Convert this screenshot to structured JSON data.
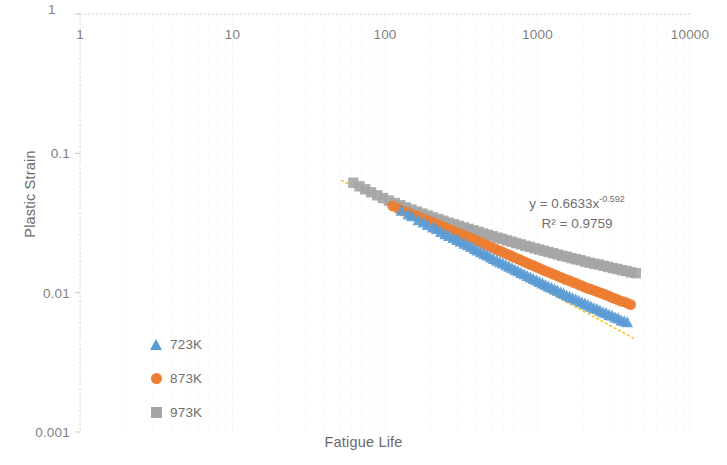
{
  "chart_data": {
    "type": "scatter",
    "title": "",
    "xlabel": "Fatigue Life",
    "ylabel": "Plastic Strain",
    "xscale": "log",
    "yscale": "log",
    "xlim": [
      1,
      10000
    ],
    "ylim": [
      0.001,
      1
    ],
    "xticks": [
      "1",
      "10",
      "100",
      "1000",
      "10000"
    ],
    "xtick_values": [
      1,
      10,
      100,
      1000,
      10000
    ],
    "yticks": [
      "1",
      "0.1",
      "0.01",
      "0.001"
    ],
    "ytick_values": [
      1,
      0.1,
      0.01,
      0.001
    ],
    "xaxis_position": "top",
    "grid": "minor-dotted",
    "legend_position": "inside-lower-left",
    "annotation": {
      "equation_prefix": "y = 0.6633x",
      "equation_exponent": "-0.592",
      "r_squared": "R² = 0.9759",
      "coefficient": 0.6633,
      "exponent": -0.592,
      "r2": 0.9759
    },
    "trendline": {
      "type": "power",
      "style": "dotted",
      "color": "#FFC000",
      "x_start": 52,
      "x_end": 4300
    },
    "colors": {
      "series_723K": "#5B9BD5",
      "series_873K": "#ED7D31",
      "series_973K": "#A5A5A5",
      "axis_text": "#7f7f7f",
      "grid": "#d9d9d9"
    },
    "series": [
      {
        "name": "723K",
        "marker": "triangle",
        "color": "#5B9BD5",
        "points": [
          [
            128,
            0.0385
          ],
          [
            142,
            0.0362
          ],
          [
            150,
            0.0352
          ],
          [
            165,
            0.033
          ],
          [
            178,
            0.0318
          ],
          [
            190,
            0.0305
          ],
          [
            205,
            0.0292
          ],
          [
            218,
            0.0285
          ],
          [
            232,
            0.0272
          ],
          [
            248,
            0.0262
          ],
          [
            262,
            0.0254
          ],
          [
            280,
            0.0246
          ],
          [
            296,
            0.0238
          ],
          [
            312,
            0.0231
          ],
          [
            330,
            0.0224
          ],
          [
            348,
            0.0218
          ],
          [
            366,
            0.0212
          ],
          [
            386,
            0.0205
          ],
          [
            404,
            0.02
          ],
          [
            424,
            0.0194
          ],
          [
            446,
            0.0189
          ],
          [
            468,
            0.0184
          ],
          [
            490,
            0.0179
          ],
          [
            514,
            0.0174
          ],
          [
            540,
            0.0169
          ],
          [
            566,
            0.0165
          ],
          [
            592,
            0.0161
          ],
          [
            620,
            0.0157
          ],
          [
            650,
            0.0153
          ],
          [
            680,
            0.0149
          ],
          [
            712,
            0.0145
          ],
          [
            745,
            0.0142
          ],
          [
            780,
            0.0138
          ],
          [
            818,
            0.0135
          ],
          [
            856,
            0.0131
          ],
          [
            896,
            0.0128
          ],
          [
            938,
            0.0125
          ],
          [
            982,
            0.0122
          ],
          [
            1028,
            0.0119
          ],
          [
            1076,
            0.0116
          ],
          [
            1126,
            0.0113
          ],
          [
            1178,
            0.011
          ],
          [
            1234,
            0.0108
          ],
          [
            1292,
            0.0105
          ],
          [
            1352,
            0.0103
          ],
          [
            1416,
            0.01
          ],
          [
            1482,
            0.0098
          ],
          [
            1552,
            0.0095
          ],
          [
            1624,
            0.0093
          ],
          [
            1700,
            0.0091
          ],
          [
            1780,
            0.0089
          ],
          [
            1864,
            0.0087
          ],
          [
            1952,
            0.0085
          ],
          [
            2044,
            0.0083
          ],
          [
            2140,
            0.0081
          ],
          [
            2240,
            0.0079
          ],
          [
            2345,
            0.0077
          ],
          [
            2455,
            0.0076
          ],
          [
            2570,
            0.0074
          ],
          [
            2690,
            0.0072
          ],
          [
            2815,
            0.0071
          ],
          [
            2948,
            0.0069
          ],
          [
            3085,
            0.0068
          ],
          [
            3230,
            0.0066
          ],
          [
            3380,
            0.0065
          ],
          [
            3540,
            0.0063
          ],
          [
            3705,
            0.0062
          ],
          [
            3880,
            0.0061
          ]
        ]
      },
      {
        "name": "873K",
        "marker": "circle",
        "color": "#ED7D31",
        "points": [
          [
            112,
            0.042
          ],
          [
            122,
            0.04
          ],
          [
            133,
            0.0385
          ],
          [
            145,
            0.0372
          ],
          [
            158,
            0.0358
          ],
          [
            170,
            0.0346
          ],
          [
            184,
            0.0334
          ],
          [
            198,
            0.0324
          ],
          [
            212,
            0.0314
          ],
          [
            228,
            0.0304
          ],
          [
            244,
            0.0295
          ],
          [
            260,
            0.0287
          ],
          [
            278,
            0.0278
          ],
          [
            296,
            0.027
          ],
          [
            315,
            0.0263
          ],
          [
            334,
            0.0256
          ],
          [
            354,
            0.0249
          ],
          [
            376,
            0.0242
          ],
          [
            398,
            0.0236
          ],
          [
            420,
            0.023
          ],
          [
            444,
            0.0224
          ],
          [
            468,
            0.0218
          ],
          [
            494,
            0.0213
          ],
          [
            520,
            0.0208
          ],
          [
            548,
            0.0202
          ],
          [
            576,
            0.0198
          ],
          [
            606,
            0.0193
          ],
          [
            637,
            0.0188
          ],
          [
            670,
            0.0184
          ],
          [
            704,
            0.0179
          ],
          [
            740,
            0.0175
          ],
          [
            777,
            0.0171
          ],
          [
            816,
            0.0167
          ],
          [
            857,
            0.0163
          ],
          [
            900,
            0.0159
          ],
          [
            945,
            0.0156
          ],
          [
            992,
            0.0152
          ],
          [
            1041,
            0.0149
          ],
          [
            1093,
            0.0145
          ],
          [
            1148,
            0.0142
          ],
          [
            1205,
            0.0139
          ],
          [
            1265,
            0.0136
          ],
          [
            1328,
            0.0133
          ],
          [
            1394,
            0.013
          ],
          [
            1464,
            0.0127
          ],
          [
            1537,
            0.0124
          ],
          [
            1614,
            0.0122
          ],
          [
            1694,
            0.0119
          ],
          [
            1779,
            0.0117
          ],
          [
            1868,
            0.0114
          ],
          [
            1961,
            0.0112
          ],
          [
            2060,
            0.0109
          ],
          [
            2163,
            0.0107
          ],
          [
            2271,
            0.0105
          ],
          [
            2385,
            0.0103
          ],
          [
            2504,
            0.0101
          ],
          [
            2629,
            0.0099
          ],
          [
            2761,
            0.0097
          ],
          [
            2899,
            0.0095
          ],
          [
            3044,
            0.0093
          ],
          [
            3196,
            0.0091
          ],
          [
            3356,
            0.0089
          ],
          [
            3524,
            0.0087
          ],
          [
            3700,
            0.0086
          ],
          [
            3885,
            0.0084
          ],
          [
            4080,
            0.0082
          ]
        ]
      },
      {
        "name": "973K",
        "marker": "square",
        "color": "#A5A5A5",
        "points": [
          [
            62,
            0.0615
          ],
          [
            68,
            0.058
          ],
          [
            74,
            0.0552
          ],
          [
            81,
            0.0525
          ],
          [
            89,
            0.05
          ],
          [
            97,
            0.0478
          ],
          [
            106,
            0.0458
          ],
          [
            116,
            0.044
          ],
          [
            126,
            0.0424
          ],
          [
            137,
            0.0409
          ],
          [
            149,
            0.0395
          ],
          [
            162,
            0.0382
          ],
          [
            176,
            0.037
          ],
          [
            191,
            0.0358
          ],
          [
            207,
            0.0347
          ],
          [
            224,
            0.0337
          ],
          [
            242,
            0.0328
          ],
          [
            262,
            0.0318
          ],
          [
            283,
            0.031
          ],
          [
            305,
            0.0302
          ],
          [
            329,
            0.0294
          ],
          [
            354,
            0.0287
          ],
          [
            381,
            0.028
          ],
          [
            410,
            0.0273
          ],
          [
            441,
            0.0266
          ],
          [
            474,
            0.026
          ],
          [
            509,
            0.0254
          ],
          [
            547,
            0.0248
          ],
          [
            587,
            0.0243
          ],
          [
            630,
            0.0237
          ],
          [
            676,
            0.0232
          ],
          [
            725,
            0.0227
          ],
          [
            777,
            0.0222
          ],
          [
            833,
            0.0217
          ],
          [
            893,
            0.0213
          ],
          [
            957,
            0.0208
          ],
          [
            1026,
            0.0204
          ],
          [
            1100,
            0.02
          ],
          [
            1179,
            0.0196
          ],
          [
            1264,
            0.0192
          ],
          [
            1355,
            0.0188
          ],
          [
            1452,
            0.0184
          ],
          [
            1556,
            0.0181
          ],
          [
            1668,
            0.0177
          ],
          [
            1788,
            0.0174
          ],
          [
            1916,
            0.0171
          ],
          [
            2054,
            0.0167
          ],
          [
            2202,
            0.0164
          ],
          [
            2360,
            0.0161
          ],
          [
            2530,
            0.0159
          ],
          [
            2712,
            0.0156
          ],
          [
            2907,
            0.0153
          ],
          [
            3116,
            0.015
          ],
          [
            3340,
            0.0148
          ],
          [
            3580,
            0.0145
          ],
          [
            3838,
            0.0143
          ],
          [
            4114,
            0.014
          ],
          [
            4410,
            0.0138
          ]
        ]
      }
    ]
  },
  "axes": {
    "x_label": "Fatigue Life",
    "y_label": "Plastic Strain",
    "x_ticks": [
      "1",
      "10",
      "100",
      "1000",
      "10000"
    ],
    "y_ticks": [
      "1",
      "0.1",
      "0.01",
      "0.001"
    ],
    "y_top_corner": "1"
  },
  "annotation": {
    "line1_prefix": "y = 0.6633x",
    "line1_exponent": "-0.592",
    "line2": "R² = 0.9759"
  },
  "legend": {
    "items": [
      {
        "label": "723K",
        "marker": "triangle-icon",
        "color": "#5B9BD5"
      },
      {
        "label": "873K",
        "marker": "circle-icon",
        "color": "#ED7D31"
      },
      {
        "label": "973K",
        "marker": "square-icon",
        "color": "#A5A5A5"
      }
    ]
  }
}
